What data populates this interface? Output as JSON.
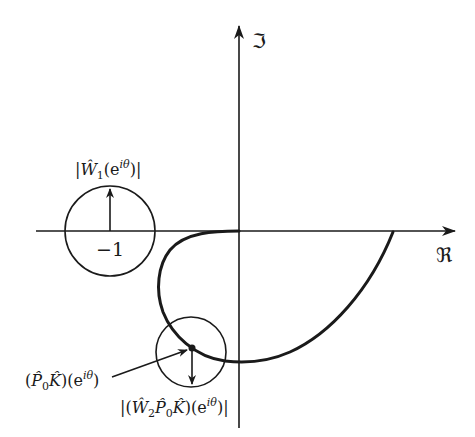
{
  "diagram": {
    "type": "nyquist-plot-robust-stability",
    "axes": {
      "real_label": "ℜ",
      "imag_label": "ℑ"
    },
    "critical_point": {
      "label": "−1",
      "circle_radius_label": "|Ŵ₁(eⁱᶿ)|"
    },
    "nyquist_point": {
      "label": "(P̂₀K̂)(eⁱᶿ)",
      "circle_radius_label": "|(Ŵ₂P̂₀K̂)(eⁱᶿ)|"
    },
    "colors": {
      "ink": "#1a1a1a",
      "background": "#ffffff"
    }
  },
  "labels": {
    "imag_axis": "ℑ",
    "real_axis": "ℜ",
    "minus_one": "−1",
    "w1_open": "|",
    "w1_hat": "Ŵ",
    "w1_sub": "1",
    "w1_arg": "(e",
    "w1_sup": "iθ",
    "w1_close": ")|",
    "p0k_open": "(",
    "p0k_P": "P̂",
    "p0k_sub": "0",
    "p0k_K": "K̂",
    "p0k_arg": ")(e",
    "p0k_sup": "iθ",
    "p0k_close": ")",
    "w2_open": "|(",
    "w2_W": "Ŵ",
    "w2_sub2": "2",
    "w2_P": "P̂",
    "w2_sub0": "0",
    "w2_K": "K̂",
    "w2_arg": ")(e",
    "w2_sup": "iθ",
    "w2_close": ")|"
  }
}
